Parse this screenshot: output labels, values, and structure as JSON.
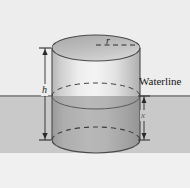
{
  "figure": {
    "name": "floating-cylinder-waterline-diagram",
    "canvas": {
      "width": 190,
      "height": 188
    },
    "background": {
      "air_color": "#ededed",
      "water_color": "#c9c9c9",
      "below_color": "#f0f0f0",
      "waterline_rule_color": "#8e8e8e",
      "waterline_y": 96
    },
    "labels": {
      "waterline": "Waterline",
      "radius": "r",
      "height": "h",
      "submerged_depth": "x"
    },
    "cylinder": {
      "center_x": 96,
      "left_x": 52,
      "right_x": 140,
      "radius_x": 44,
      "top_ellipse_cy": 48,
      "bottom_ellipse_cy": 140,
      "ellipse_ry": 13,
      "top_face_color": "#b9b9b9",
      "body_above_water_color": "#e6e6e6",
      "body_below_water_color": "#a9a9a9",
      "outline_color": "#4a4a4a",
      "dashed_color": "#3c3c3c"
    },
    "dimensions": [
      {
        "id": "h",
        "label": "h",
        "orientation": "vertical",
        "x": 45,
        "from_y": 48,
        "to_y": 140,
        "arrowheads": "both"
      },
      {
        "id": "x",
        "label": "x",
        "orientation": "vertical",
        "x": 144,
        "from_y": 96,
        "to_y": 140,
        "arrowheads": "both"
      },
      {
        "id": "r",
        "label": "r",
        "orientation": "horizontal-dashed",
        "y": 48,
        "from_x": 96,
        "to_x": 137
      }
    ]
  }
}
